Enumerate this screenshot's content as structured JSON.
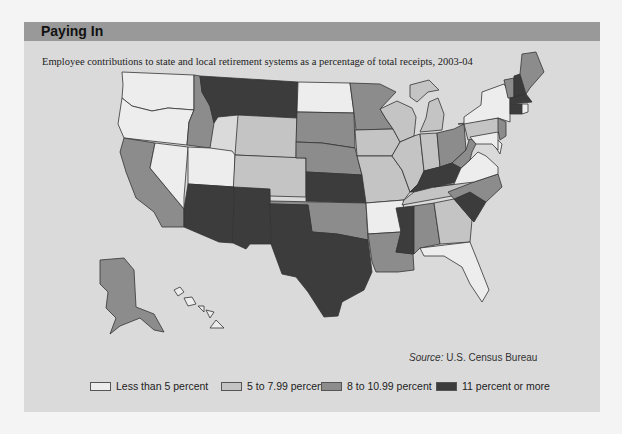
{
  "header": {
    "title": "Paying In"
  },
  "subtitle": "Employee contributions to state and local retirement systems as a percentage of total receipts, 2003-04",
  "source": {
    "label": "Source:",
    "text": " U.S. Census Bureau"
  },
  "colors": {
    "panel_bg": "#dadada",
    "header_bg": "#999999",
    "lt5": "#ededed",
    "5to8": "#c4c4c4",
    "8to11": "#8c8c8c",
    "11plus": "#3c3c3c"
  },
  "legend": [
    {
      "key": "lt5",
      "label": "Less than 5 percent"
    },
    {
      "key": "5to8",
      "label": "5 to 7.99 percent"
    },
    {
      "key": "8to11",
      "label": "8 to 10.99 percent"
    },
    {
      "key": "11plus",
      "label": "11 percent or more"
    }
  ],
  "chart_data": {
    "type": "choropleth",
    "title": "Paying In",
    "subtitle": "Employee contributions to state and local retirement systems as a percentage of total receipts, 2003-04",
    "source": "U.S. Census Bureau",
    "categories": [
      "Less than 5 percent",
      "5 to 7.99 percent",
      "8 to 10.99 percent",
      "11 percent or more"
    ],
    "states": {
      "WA": "Less than 5 percent",
      "OR": "Less than 5 percent",
      "CA": "8 to 10.99 percent",
      "NV": "Less than 5 percent",
      "ID": "8 to 10.99 percent",
      "MT": "11 percent or more",
      "WY": "5 to 7.99 percent",
      "UT": "Less than 5 percent",
      "CO": "5 to 7.99 percent",
      "AZ": "11 percent or more",
      "NM": "11 percent or more",
      "ND": "Less than 5 percent",
      "SD": "8 to 10.99 percent",
      "NE": "8 to 10.99 percent",
      "KS": "11 percent or more",
      "OK": "8 to 10.99 percent",
      "TX": "11 percent or more",
      "MN": "8 to 10.99 percent",
      "IA": "5 to 7.99 percent",
      "MO": "5 to 7.99 percent",
      "AR": "Less than 5 percent",
      "LA": "8 to 10.99 percent",
      "WI": "5 to 7.99 percent",
      "IL": "5 to 7.99 percent",
      "MI": "5 to 7.99 percent",
      "IN": "5 to 7.99 percent",
      "OH": "8 to 10.99 percent",
      "KY": "11 percent or more",
      "TN": "5 to 7.99 percent",
      "MS": "11 percent or more",
      "AL": "8 to 10.99 percent",
      "GA": "5 to 7.99 percent",
      "FL": "Less than 5 percent",
      "SC": "11 percent or more",
      "NC": "8 to 10.99 percent",
      "VA": "Less than 5 percent",
      "WV": "8 to 10.99 percent",
      "PA": "5 to 7.99 percent",
      "NY": "Less than 5 percent",
      "NJ": "8 to 10.99 percent",
      "DE": "Less than 5 percent",
      "MD": "Less than 5 percent",
      "VT": "8 to 10.99 percent",
      "NH": "11 percent or more",
      "ME": "8 to 10.99 percent",
      "MA": "11 percent or more",
      "CT": "11 percent or more",
      "RI": "Less than 5 percent",
      "AK": "8 to 10.99 percent",
      "HI": "Less than 5 percent"
    }
  }
}
